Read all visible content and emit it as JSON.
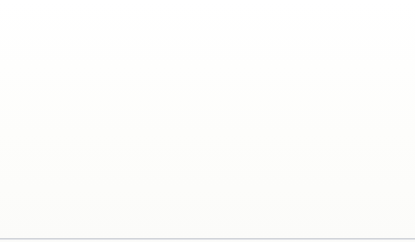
{
  "chart_data": {
    "type": "pie",
    "title": "",
    "subtitle": "",
    "xlabel": "",
    "ylabel": "",
    "legend_position": "right",
    "grid": false,
    "units": "percent",
    "start_angle_deg": 0,
    "direction": "clockwise",
    "categories": [
      "Religion",
      "Education",
      "Human Services",
      "Health",
      "Public-Society Benefit",
      "Arts, Culture, Humanities",
      "International Affairs",
      "Environment/Animals",
      "Gifts to Foundations",
      "Gifts to Individuals"
    ],
    "values": [
      32,
      15,
      12,
      8,
      7,
      5,
      4,
      3,
      12,
      2
    ],
    "value_labels": [
      "32%",
      "15%",
      "12%",
      "8%",
      "7%",
      "5%",
      "4%",
      "3%",
      "12%",
      "2%"
    ],
    "colors": [
      "#3d6cb4",
      "#c4302f",
      "#8cb14b",
      "#532480",
      "#6f9cd3",
      "#e8711d",
      "#8b60a9",
      "#e19b8f",
      "#6e903d",
      "#a87ece"
    ],
    "label_placement": [
      "inside",
      "inside",
      "inside",
      "inside",
      "inside",
      "inside",
      "inside",
      "outside",
      "inside",
      "outside"
    ],
    "slices": [
      {
        "label": "Religion",
        "value": 32,
        "value_label": "32%",
        "color": "#3d6cb4",
        "placement": "inside",
        "label_x": 173,
        "label_y": 87
      },
      {
        "label": "Education",
        "value": 15,
        "value_label": "15%",
        "color": "#c4302f",
        "placement": "inside",
        "label_x": 166,
        "label_y": 186
      },
      {
        "label": "Human Services",
        "value": 12,
        "value_label": "12%",
        "color": "#8cb14b",
        "placement": "inside",
        "label_x": 113,
        "label_y": 205
      },
      {
        "label": "Health",
        "value": 8,
        "value_label": "8%",
        "color": "#532480",
        "placement": "inside",
        "label_x": 73,
        "label_y": 184
      },
      {
        "label": "Public-Society Benefit",
        "value": 7,
        "value_label": "7%",
        "color": "#6f9cd3",
        "placement": "inside",
        "label_x": 53,
        "label_y": 148
      },
      {
        "label": "Arts, Culture, Humanities",
        "value": 5,
        "value_label": "5%",
        "color": "#e8711d",
        "placement": "inside",
        "label_x": 48,
        "label_y": 121
      },
      {
        "label": "International Affairs",
        "value": 4,
        "value_label": "4%",
        "color": "#8b60a9",
        "placement": "inside",
        "label_x": 56,
        "label_y": 96
      },
      {
        "label": "Environment/Animals",
        "value": 3,
        "value_label": "3%",
        "color": "#e19b8f",
        "placement": "outside",
        "label_x": 32,
        "label_y": 65
      },
      {
        "label": "Gifts to Foundations",
        "value": 12,
        "value_label": "12%",
        "color": "#6e903d",
        "placement": "inside",
        "label_x": 91,
        "label_y": 53
      },
      {
        "label": "Gifts to Individuals",
        "value": 2,
        "value_label": "2%",
        "color": "#a87ece",
        "placement": "outside",
        "label_x": 121,
        "label_y": 16
      }
    ]
  },
  "legend": {
    "items": [
      {
        "label": "Religion",
        "color": "#3d6cb4"
      },
      {
        "label": "Education",
        "color": "#c4302f"
      },
      {
        "label": "Human Services",
        "color": "#8cb14b"
      },
      {
        "label": "Health",
        "color": "#532480"
      },
      {
        "label": "Public-Society Benefit",
        "color": "#6f9cd3"
      },
      {
        "label": "Arts, Culture, Humanities",
        "color": "#e8711d"
      },
      {
        "label": "International Affairs",
        "color": "#8b60a9"
      },
      {
        "label": "Environment/Animals",
        "color": "#e19b8f"
      },
      {
        "label": "Gifts to Foundations",
        "color": "#6e903d"
      },
      {
        "label": "Gifts to Individuals",
        "color": "#a87ece"
      }
    ]
  }
}
